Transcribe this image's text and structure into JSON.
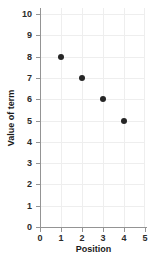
{
  "chart_data": {
    "type": "scatter",
    "title": "",
    "xlabel": "Position",
    "ylabel": "Value of term",
    "xlim": [
      0,
      5
    ],
    "ylim": [
      0,
      10
    ],
    "x": [
      1,
      2,
      3,
      4
    ],
    "values": [
      8,
      7,
      6,
      5
    ],
    "points": [
      {
        "x": 1,
        "y": 8
      },
      {
        "x": 2,
        "y": 7
      },
      {
        "x": 3,
        "y": 6
      },
      {
        "x": 4,
        "y": 5
      }
    ],
    "xticks": [
      "0",
      "1",
      "2",
      "3",
      "4",
      "5"
    ],
    "yticks": [
      "0",
      "1",
      "2",
      "3",
      "4",
      "5",
      "6",
      "7",
      "8",
      "9",
      "10"
    ],
    "grid": true,
    "legend": null,
    "marker_color": "#262626",
    "grid_color": "#eeeeee",
    "axis_color": "#949494",
    "label_color": "#2b2b2b"
  }
}
